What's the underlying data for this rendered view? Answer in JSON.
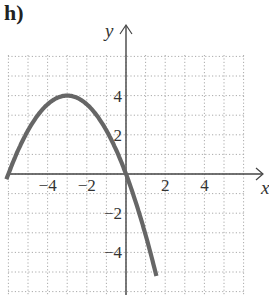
{
  "panel_label": "h)",
  "chart_data": {
    "type": "line",
    "title": "",
    "xlabel": "x",
    "ylabel": "y",
    "xlim": [
      -6,
      6
    ],
    "ylim": [
      -6,
      6
    ],
    "grid": true,
    "x_ticks": [
      -4,
      -2,
      2,
      4
    ],
    "y_ticks": [
      4,
      2,
      -2,
      -4
    ],
    "x_tick_labels": [
      "−4",
      "−2",
      "2",
      "4"
    ],
    "y_tick_labels": [
      "4",
      "2",
      "−2",
      "−4"
    ],
    "series": [
      {
        "name": "parabola",
        "equation": "y = -4/9 (x + 3)^2 + 4",
        "vertex": [
          -3,
          4
        ],
        "x_intercepts": [
          -6,
          0
        ],
        "x": [
          -6.1,
          -6,
          -5,
          -4,
          -3,
          -2,
          -1,
          0,
          1,
          1.5
        ],
        "y": [
          -0.09,
          0,
          2.22,
          3.56,
          4,
          3.56,
          2.22,
          0,
          -3.11,
          -5
        ],
        "color": "#666666"
      }
    ]
  }
}
